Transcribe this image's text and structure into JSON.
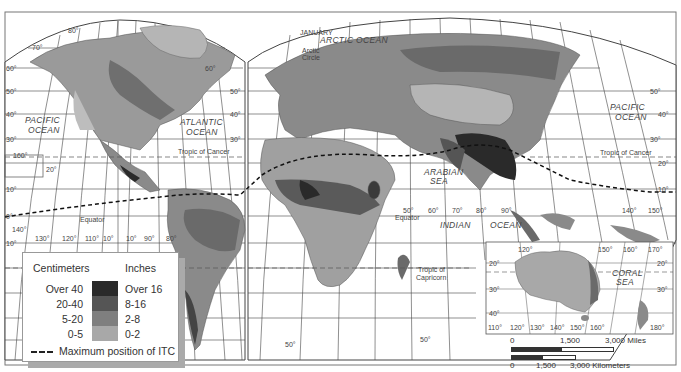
{
  "map": {
    "title": "JANUARY",
    "colors": {
      "over40": "#2a2a2a",
      "20to40": "#555555",
      "5to20": "#7f7f7f",
      "0to5": "#a8a8a8",
      "land_light": "#bdbdbd",
      "water": "#ffffff",
      "grid": "#333333"
    },
    "ocean_labels": [
      {
        "name": "PACIFIC OCEAN",
        "line1": "PACIFIC",
        "line2": "OCEAN",
        "region": "west"
      },
      {
        "name": "ATLANTIC OCEAN",
        "line1": "ATLANTIC",
        "line2": "OCEAN"
      },
      {
        "name": "ARCTIC OCEAN",
        "line1": "ARCTIC OCEAN"
      },
      {
        "name": "PACIFIC OCEAN",
        "line1": "PACIFIC",
        "line2": "OCEAN",
        "region": "east"
      },
      {
        "name": "INDIAN OCEAN",
        "line1": "INDIAN",
        "line2": "OCEAN"
      },
      {
        "name": "ARABIAN SEA",
        "line1": "ARABIAN",
        "line2": "SEA"
      },
      {
        "name": "CORAL SEA",
        "line1": "CORAL",
        "line2": "SEA"
      }
    ],
    "line_labels": {
      "arctic_circle_1": "Arctic",
      "arctic_circle_2": "Circle",
      "tropic_cancer_w": "Tropic of Cancer",
      "tropic_cancer_e": "Tropic of Cancer",
      "equator_w": "Equator",
      "equator_e": "Equator",
      "tropic_capricorn_1": "Tropic of",
      "tropic_capricorn_2": "Capricorn"
    },
    "latitude_ticks": [
      "80°",
      "70°",
      "60°",
      "50°",
      "40°",
      "30°",
      "20°",
      "10°",
      "0°",
      "10°",
      "20°",
      "30°",
      "40°",
      "50°"
    ],
    "longitude_ticks_west": [
      "160°",
      "140°",
      "130°",
      "120°",
      "110°",
      "10°",
      "10°",
      "90°",
      "80°"
    ],
    "longitude_ticks_east": [
      "50°",
      "60°",
      "70°",
      "80°",
      "90°",
      "140°",
      "150°"
    ],
    "inset": {
      "name": "Australia inset",
      "lon_top": [
        "120°",
        "150°",
        "160°",
        "170°"
      ],
      "lon_bottom": [
        "110°",
        "120°",
        "130°",
        "140°",
        "150°",
        "160°",
        "180°"
      ],
      "lat": [
        "20°",
        "30°",
        "40°"
      ]
    }
  },
  "legend": {
    "col1_header": "Centimeters",
    "col2_header": "Inches",
    "rows": [
      {
        "cm": "Over 40",
        "in": "Over 16",
        "color": "#2a2a2a"
      },
      {
        "cm": "20-40",
        "in": "8-16",
        "color": "#555555"
      },
      {
        "cm": "5-20",
        "in": "2-8",
        "color": "#7f7f7f"
      },
      {
        "cm": "0-5",
        "in": "0-2",
        "color": "#a8a8a8"
      }
    ],
    "itc_label": "Maximum position of ITC"
  },
  "scale_bar": {
    "miles": {
      "start": "0",
      "mid": "1,500",
      "end": "3,000 Miles"
    },
    "km": {
      "start": "0",
      "mid": "1,500",
      "end": "3,000 Kilometers"
    }
  }
}
